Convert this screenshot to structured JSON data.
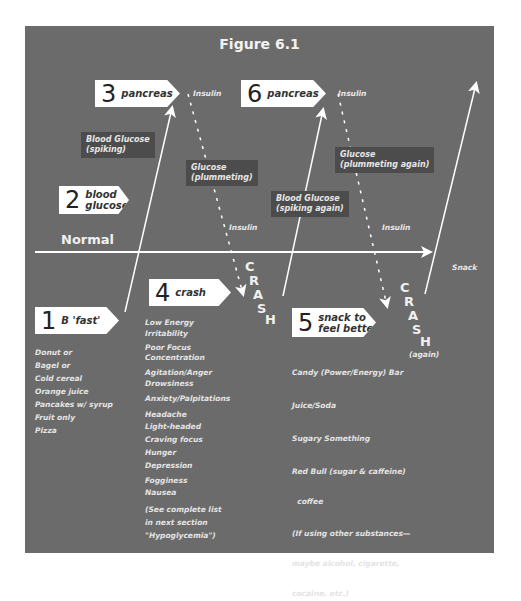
{
  "title": "Figure 6.1",
  "colors": {
    "panel": "#6b6b6b",
    "dark_label": "#4c4c4c",
    "arrow": "#ffffff",
    "text": "#e8e8e8"
  },
  "normal_label": "Normal",
  "steps": [
    {
      "num": "1",
      "label": "B 'fast'"
    },
    {
      "num": "2",
      "label": "blood\nglucose"
    },
    {
      "num": "3",
      "label": "pancreas"
    },
    {
      "num": "4",
      "label": "crash"
    },
    {
      "num": "5",
      "label": "snack to\nfeel better"
    },
    {
      "num": "6",
      "label": "pancreas"
    }
  ],
  "dark_labels": {
    "bg_spiking": "Blood Glucose\n(spiking)",
    "glucose_plummeting": "Glucose\n(plummeting)",
    "bg_spiking_again": "Blood Glucose\n(spiking again)",
    "glucose_plummeting_again": "Glucose\n(plummeting again)"
  },
  "small_labels": {
    "insulin_1": "Insulin",
    "insulin_2": "Insulin",
    "insulin_3": "Insulin",
    "insulin_4": "Insulin",
    "snack": "Snack",
    "again": "(again)"
  },
  "crash_letters": [
    "C",
    "R",
    "A",
    "S",
    "H"
  ],
  "breakfast_items": [
    "Donut or",
    "Bagel or",
    "Cold cereal",
    "Orange juice",
    "Pancakes w/ syrup",
    "Fruit only",
    "Pizza"
  ],
  "crash_symptoms": [
    "Low Energy",
    "Irritability",
    "Poor Focus",
    "Concentration",
    "Agitation/Anger",
    "Drowsiness",
    "Anxiety/Palpitations",
    "Headache",
    "Light-headed",
    "Craving focus",
    "Hunger",
    "Depression",
    "Fogginess",
    "Nausea",
    "(See complete list",
    "in next section",
    "\"Hypoglycemia\")"
  ],
  "snack_items": [
    "Candy (Power/Energy) Bar",
    "Juice/Soda",
    "Sugary Something",
    "Red Bull (sugar & caffeine)",
    "  coffee",
    "(If using other substances—",
    "maybe alcohol, cigarette,",
    "cocaine, etc.)"
  ]
}
